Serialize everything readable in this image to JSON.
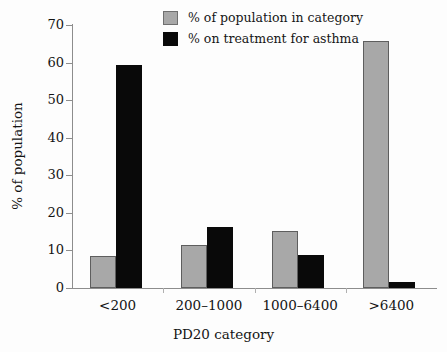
{
  "chart_data": {
    "type": "bar",
    "title": "",
    "xlabel": "PD20 category",
    "ylabel": "% of population",
    "categories": [
      "<200",
      "200–1000",
      "1000–6400",
      ">6400"
    ],
    "series": [
      {
        "name": "% of population in category",
        "color": "#a8a8a8",
        "values": [
          8.5,
          11.4,
          15.2,
          65.8
        ]
      },
      {
        "name": "% on treatment for asthma",
        "color": "#090909",
        "values": [
          59.3,
          16.2,
          8.8,
          1.7
        ]
      }
    ],
    "ylim": [
      0,
      70
    ],
    "yticks": [
      0,
      10,
      20,
      30,
      40,
      50,
      60,
      70
    ],
    "ytick_labels": [
      "0",
      "10",
      "20",
      "30",
      "40",
      "50",
      "60",
      "70"
    ],
    "grid": false,
    "legend_position": "top-center"
  },
  "legend": {
    "items": [
      {
        "label": "% of population in category",
        "swatch": "gray-swatch-icon"
      },
      {
        "label": "% on treatment for asthma",
        "swatch": "black-swatch-icon"
      }
    ]
  }
}
